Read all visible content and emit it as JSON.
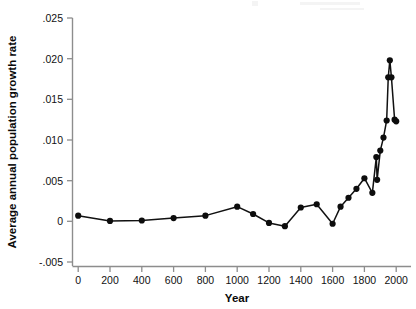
{
  "chart_data": {
    "type": "line",
    "title": "",
    "subtitle": "",
    "xlabel": "Year",
    "ylabel": "Average annual population growth rate",
    "xlim": [
      -100,
      2060
    ],
    "ylim": [
      -0.005,
      0.025
    ],
    "xticks": [
      0,
      200,
      400,
      600,
      800,
      1000,
      1200,
      1400,
      1600,
      1800,
      2000
    ],
    "xticklabels": [
      "0",
      "200",
      "400",
      "600",
      "800",
      "1000",
      "1200",
      "1400",
      "1600",
      "1800",
      "2000"
    ],
    "yticks": [
      -0.005,
      0,
      0.005,
      0.01,
      0.015,
      0.02,
      0.025
    ],
    "yticklabels": [
      "-.005",
      "0",
      ".005",
      ".010",
      ".015",
      ".020",
      ".025"
    ],
    "grid": false,
    "legend": "none",
    "marker": "filled-circle",
    "line_color": "#111111",
    "marker_color": "#0d0d0d",
    "axis_color": "#8d8d8d",
    "background_color": "#ffffff",
    "series": [
      {
        "name": "Average annual population growth rate",
        "x": [
          0,
          200,
          400,
          600,
          800,
          1000,
          1100,
          1200,
          1300,
          1400,
          1500,
          1600,
          1650,
          1700,
          1750,
          1800,
          1850,
          1875,
          1880,
          1900,
          1920,
          1940,
          1950,
          1960,
          1970,
          1990,
          2000
        ],
        "y": [
          0.0007,
          5e-05,
          0.0001,
          0.0004,
          0.0007,
          0.0018,
          0.0009,
          -0.0002,
          -0.0006,
          0.0017,
          0.0021,
          -0.0003,
          0.0018,
          0.0029,
          0.004,
          0.0053,
          0.0035,
          0.0079,
          0.0051,
          0.0087,
          0.0103,
          0.0124,
          0.0177,
          0.0198,
          0.0177,
          0.0125,
          0.0123
        ]
      }
    ]
  },
  "axes": {
    "x_axis_name": "year-axis",
    "y_axis_name": "growth-rate-axis"
  }
}
